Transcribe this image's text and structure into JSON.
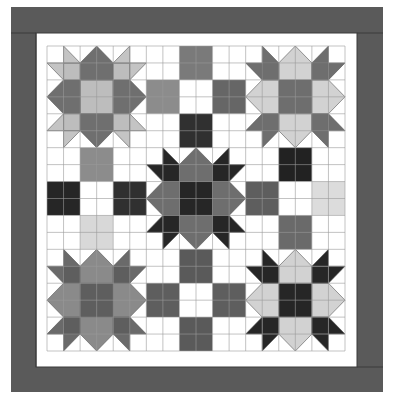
{
  "colors": {
    "background": "#ffffff",
    "border": "#5a5a5a",
    "border_edge": "#3a3a3a",
    "inner_border": "#ffffff",
    "grid_line": "#9a9a9a",
    "white": "#ffffff"
  },
  "star_blocks": [
    {
      "name": "star-top-left",
      "row": 0,
      "col": 0,
      "center": "#bdbdbd",
      "petal": "#6f6f6f",
      "corner": "#bdbdbd",
      "point": "#c4c4c4"
    },
    {
      "name": "star-top-right",
      "row": 0,
      "col": 2,
      "center": "#6e6e6e",
      "petal": "#d2d2d2",
      "corner": "#6e6e6e",
      "point": "#6e6e6e"
    },
    {
      "name": "star-center",
      "row": 1,
      "col": 1,
      "center": "#262626",
      "petal": "#6e6e6e",
      "corner": "#262626",
      "point": "#262626"
    },
    {
      "name": "star-bottom-left",
      "row": 2,
      "col": 0,
      "center": "#5e5e5e",
      "petal": "#8a8a8a",
      "corner": "#5e5e5e",
      "point": "#6a6a6a"
    },
    {
      "name": "star-bottom-right",
      "row": 2,
      "col": 2,
      "center": "#262626",
      "petal": "#d2d2d2",
      "corner": "#262626",
      "point": "#262626"
    }
  ],
  "patch_blocks": [
    {
      "name": "patch-top-middle",
      "row": 0,
      "col": 1,
      "cells": [
        "#ffffff",
        "#7a7a7a",
        "#ffffff",
        "#8c8c8c",
        "#ffffff",
        "#666666",
        "#ffffff",
        "#303030",
        "#ffffff"
      ]
    },
    {
      "name": "patch-middle-left",
      "row": 1,
      "col": 0,
      "cells": [
        "#ffffff",
        "#8c8c8c",
        "#ffffff",
        "#262626",
        "#ffffff",
        "#303030",
        "#ffffff",
        "#d8d8d8",
        "#ffffff"
      ]
    },
    {
      "name": "patch-middle-right",
      "row": 1,
      "col": 2,
      "cells": [
        "#ffffff",
        "#222222",
        "#ffffff",
        "#5e5e5e",
        "#ffffff",
        "#dcdcdc",
        "#ffffff",
        "#6a6a6a",
        "#ffffff"
      ]
    },
    {
      "name": "patch-bottom-middle",
      "row": 2,
      "col": 1,
      "cells": [
        "#ffffff",
        "#5a5a5a",
        "#ffffff",
        "#5e5e5e",
        "#ffffff",
        "#5e5e5e",
        "#ffffff",
        "#5a5a5a",
        "#ffffff"
      ]
    }
  ]
}
